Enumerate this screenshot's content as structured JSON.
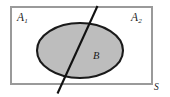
{
  "figure": {
    "type": "venn-diagram",
    "caption": "",
    "canvas": {
      "width": 170,
      "height": 97,
      "background": "#ffffff"
    },
    "universe": {
      "name": "S",
      "label": "S",
      "shape": "rectangle",
      "x": 11,
      "y": 7,
      "width": 141,
      "height": 77,
      "fill": "#ffffff",
      "stroke": "#9a9a9a",
      "stroke_width": 1.2,
      "label_position": "outside-bottom-right"
    },
    "regions": [
      {
        "name": "A1",
        "label": "A",
        "subscript": "1",
        "label_position": "top-left",
        "description": "left half of universe, divided by the diagonal line"
      },
      {
        "name": "A2",
        "label": "A",
        "subscript": "2",
        "label_position": "top-right",
        "description": "right half of universe, divided by the diagonal line"
      }
    ],
    "set_b": {
      "name": "B",
      "label": "B",
      "shape": "ellipse",
      "cx": 80,
      "cy": 50.5,
      "rx": 43,
      "ry": 27.5,
      "fill": "#bdbdbd",
      "stroke": "#1a1a1a",
      "stroke_width": 2.1,
      "label_position": "inside-right-of-divider"
    },
    "divider": {
      "name": "partition-line",
      "shape": "line",
      "x1": 97.5,
      "y1": 6,
      "x2": 57.5,
      "y2": 93.5,
      "stroke": "#111111",
      "stroke_width": 2.1,
      "description": "diagonal line splitting the universe into A1 and A2, extends beyond the rectangle at both ends"
    }
  }
}
